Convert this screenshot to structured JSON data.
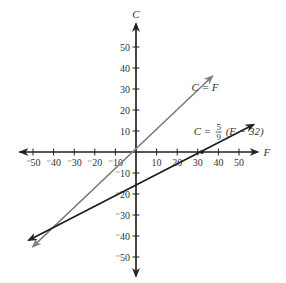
{
  "chart_data": {
    "type": "line",
    "title": "",
    "xlabel": "F",
    "ylabel": "C",
    "xlim": [
      -57,
      59
    ],
    "ylim": [
      -59,
      61
    ],
    "grid": false,
    "x_ticks": [
      -50,
      -40,
      -30,
      -20,
      -10,
      10,
      20,
      30,
      40,
      50
    ],
    "y_ticks": [
      50,
      40,
      30,
      20,
      10,
      -10,
      -20,
      -30,
      -40,
      -50
    ],
    "x_tick_labels": [
      "⁻50",
      "⁻40",
      "⁻30",
      "⁻20",
      "⁻10",
      "10",
      "20",
      "30",
      "40",
      "50"
    ],
    "y_tick_labels": [
      "50",
      "40",
      "30",
      "20",
      "10",
      "⁻10",
      "⁻20",
      "⁻30",
      "⁻40",
      "⁻50"
    ],
    "series": [
      {
        "name": "C = F",
        "equation": "C = F",
        "color": "#808080",
        "x": [
          -50,
          37
        ],
        "y": [
          -45,
          36
        ]
      },
      {
        "name": "C = 5/9 (F - 32)",
        "equation_lhs": "C = ",
        "equation_num": "5",
        "equation_den": "9",
        "equation_rhs": "(F − 32)",
        "color": "#222222",
        "x": [
          -52,
          57
        ],
        "y": [
          -42,
          13
        ]
      }
    ],
    "annotations": [
      {
        "text": "C = F",
        "x": 27,
        "y": 29
      },
      {
        "text": "C = 5/9 (F − 32)",
        "x": 28,
        "y": 10
      }
    ],
    "marked_points": [
      {
        "x": 32,
        "y": 0
      }
    ],
    "axis_color": "#222222",
    "legend": "none"
  }
}
